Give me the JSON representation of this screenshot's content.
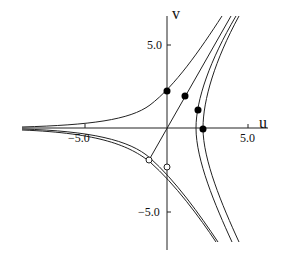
{
  "axes": {
    "x_label": "u",
    "y_label": "v"
  },
  "ticks": {
    "x": [
      {
        "value": -5.0,
        "label": "−5.0"
      },
      {
        "value": 5.0,
        "label": "5.0"
      }
    ],
    "y": [
      {
        "value": 5.0,
        "label": "5.0"
      },
      {
        "value": -5.0,
        "label": "−5.0"
      }
    ]
  },
  "points": {
    "filled": [
      [
        0.0,
        2.2
      ],
      [
        1.1,
        1.9
      ],
      [
        1.9,
        1.1
      ],
      [
        2.2,
        0.0
      ]
    ],
    "open": [
      [
        -1.1,
        -1.9
      ],
      [
        0.0,
        -2.2
      ]
    ]
  }
}
